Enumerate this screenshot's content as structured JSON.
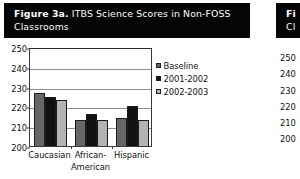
{
  "figure": {
    "label": "Figure 3a.",
    "caption": "ITBS Science Scores in Non-FOSS Classrooms",
    "title_bar_color": "#050505",
    "title_text_color": "#ffffff"
  },
  "partial_figure": {
    "label": "Fi",
    "caption": "Cl",
    "ticks": [
      "250",
      "240",
      "230",
      "220",
      "210",
      "200"
    ]
  },
  "chart_data": {
    "type": "bar",
    "title": "ITBS Science Scores in Non-FOSS Classrooms",
    "xlabel": "",
    "ylabel": "",
    "ylim": [
      200,
      250
    ],
    "yticks": [
      200,
      210,
      220,
      230,
      240,
      250
    ],
    "ytick_labels": [
      "200",
      "210",
      "220",
      "230",
      "240",
      "250"
    ],
    "grid": true,
    "legend_position": "right",
    "categories": [
      "Caucasian",
      "African-American",
      "Hispanic"
    ],
    "category_lines": [
      [
        "Caucasian",
        ""
      ],
      [
        "African-",
        "American"
      ],
      [
        "Hispanic",
        ""
      ]
    ],
    "series": [
      {
        "name": "Baseline",
        "color": "#666666",
        "values": [
          227,
          213,
          214
        ]
      },
      {
        "name": "2001-2002",
        "color": "#111111",
        "values": [
          225,
          216,
          220
        ]
      },
      {
        "name": "2002-2003",
        "color": "#b3b3b3",
        "values": [
          223,
          213,
          213
        ]
      }
    ]
  }
}
